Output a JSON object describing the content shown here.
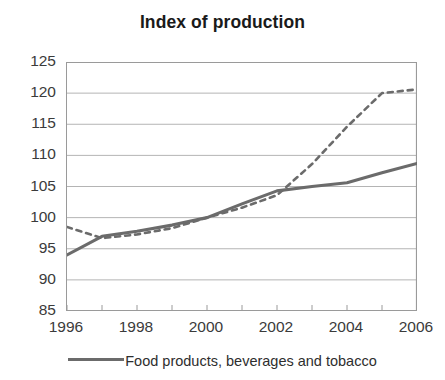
{
  "chart_data": {
    "type": "line",
    "title": "Index of production",
    "xlabel": "",
    "ylabel": "",
    "xlim": [
      1996,
      2006
    ],
    "ylim": [
      85,
      125
    ],
    "yticks": [
      85,
      90,
      95,
      100,
      105,
      110,
      115,
      120,
      125
    ],
    "xticks": [
      1996,
      1998,
      2000,
      2002,
      2004,
      2006
    ],
    "xtick_all": [
      1996,
      1997,
      1998,
      1999,
      2000,
      2001,
      2002,
      2003,
      2004,
      2005,
      2006
    ],
    "grid": "horizontal",
    "legend_position": "bottom",
    "x": [
      1996,
      1997,
      1998,
      1999,
      2000,
      2001,
      2002,
      2003,
      2004,
      2005,
      2006
    ],
    "series": [
      {
        "name": "Food products, beverages and tobacco",
        "style": "solid",
        "color": "#6b6b6b",
        "values": [
          94.0,
          97.0,
          97.8,
          98.8,
          100.0,
          102.2,
          104.3,
          105.0,
          105.6,
          107.2,
          108.7
        ]
      },
      {
        "name": "",
        "style": "dashed",
        "color": "#6b6b6b",
        "values": [
          98.5,
          96.7,
          97.3,
          98.3,
          100.0,
          101.6,
          103.6,
          108.6,
          114.6,
          120.0,
          120.6
        ]
      }
    ]
  },
  "legend": {
    "entries": [
      {
        "label": "Food products, beverages and tobacco",
        "style": "solid"
      }
    ]
  },
  "axis": {
    "y_labels": [
      "125",
      "120",
      "115",
      "110",
      "105",
      "100",
      "95",
      "90",
      "85"
    ],
    "x_labels": [
      "1996",
      "1998",
      "2000",
      "2002",
      "2004",
      "2006"
    ]
  }
}
